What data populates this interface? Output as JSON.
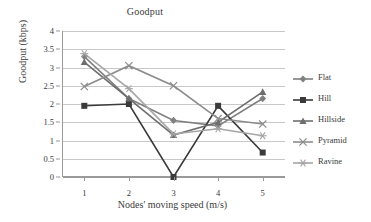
{
  "chart_data": {
    "type": "line",
    "title": "Goodput",
    "xlabel": "Nodes' moving speed (m/s)",
    "ylabel": "Goodput (kbps)",
    "x": [
      1,
      2,
      3,
      4,
      5
    ],
    "categories": [
      "1",
      "2",
      "3",
      "4",
      "5"
    ],
    "xtick_labels": [
      "1",
      "2",
      "3",
      "4",
      "5"
    ],
    "ytick_labels": [
      "0",
      "0.5",
      "1",
      "1.5",
      "2",
      "2.5",
      "3",
      "3.5",
      "4"
    ],
    "ytick_values": [
      0,
      0.5,
      1,
      1.5,
      2,
      2.5,
      3,
      3.5,
      4
    ],
    "ylim": [
      0,
      4
    ],
    "xlim": [
      0.5,
      5.5
    ],
    "grid": "horizontal",
    "legend_position": "right",
    "series": [
      {
        "name": "Flat",
        "marker": "diamond",
        "color": "#808080",
        "values": [
          3.3,
          2.15,
          1.55,
          1.4,
          2.15
        ]
      },
      {
        "name": "Hill",
        "marker": "square",
        "color": "#3a3a3a",
        "values": [
          1.95,
          2.0,
          0.0,
          1.95,
          0.67
        ]
      },
      {
        "name": "Hillside",
        "marker": "triangle",
        "color": "#6e6e6e",
        "values": [
          3.15,
          2.15,
          1.15,
          1.5,
          2.33
        ]
      },
      {
        "name": "Pyramid",
        "marker": "x",
        "color": "#8c8c8c",
        "values": [
          2.48,
          3.05,
          2.5,
          1.6,
          1.45
        ]
      },
      {
        "name": "Ravine",
        "marker": "star",
        "color": "#a6a6a6",
        "values": [
          3.38,
          2.42,
          1.18,
          1.32,
          1.13
        ]
      }
    ]
  }
}
